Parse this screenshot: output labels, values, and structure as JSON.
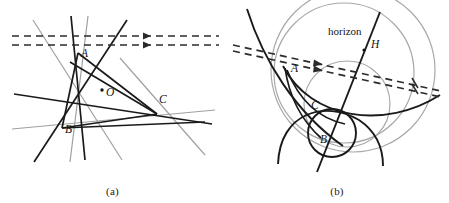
{
  "figure": {
    "caption_a": "(a)",
    "caption_b": "(b)",
    "width": 449,
    "height": 203,
    "background": "#ffffff"
  },
  "colors": {
    "dark_line": "#1a1a1a",
    "gray_line": "#9a9a9a",
    "light_gray_circle": "#a8a8a8",
    "dashed_line": "#2b2b2b",
    "label_text": "#151515",
    "page_background": "#ffffff"
  },
  "panel_a": {
    "name": "(a)",
    "labels": [
      {
        "id": "A",
        "text": "A",
        "x": 81,
        "y": 57
      },
      {
        "id": "B",
        "text": "B",
        "x": 65,
        "y": 133
      },
      {
        "id": "C",
        "text": "C",
        "x": 159,
        "y": 103
      },
      {
        "id": "O",
        "text": "O",
        "x": 106,
        "y": 96
      }
    ],
    "center_point": {
      "id": "O",
      "x": 102,
      "y": 90
    },
    "dashed_lines": [
      {
        "y": 36,
        "x1": 12,
        "x2": 219,
        "arrow_x": 148
      },
      {
        "y": 45,
        "x1": 12,
        "x2": 219,
        "arrow_x": 148
      }
    ]
  },
  "panel_b": {
    "name": "(b)",
    "labels": [
      {
        "id": "horizon",
        "text": "horizon",
        "x": 103,
        "y": 35
      },
      {
        "id": "H",
        "text": "H",
        "x": 146,
        "y": 48
      },
      {
        "id": "A",
        "text": "A",
        "x": 66,
        "y": 72
      },
      {
        "id": "C",
        "text": "C",
        "x": 86,
        "y": 109
      },
      {
        "id": "B",
        "text": "B",
        "x": 95,
        "y": 143
      }
    ],
    "dashed_lines": [
      {
        "x1": 8,
        "y1": 45,
        "x2": 216,
        "y2": 91,
        "arrow_x": 96,
        "arrow_y": 64
      },
      {
        "x1": 8,
        "y1": 51,
        "x2": 216,
        "y2": 97,
        "arrow_x": 96,
        "arrow_y": 70
      }
    ],
    "tick_marks": [
      {
        "x": 190,
        "y": 81
      },
      {
        "x": 190,
        "y": 88
      }
    ]
  }
}
